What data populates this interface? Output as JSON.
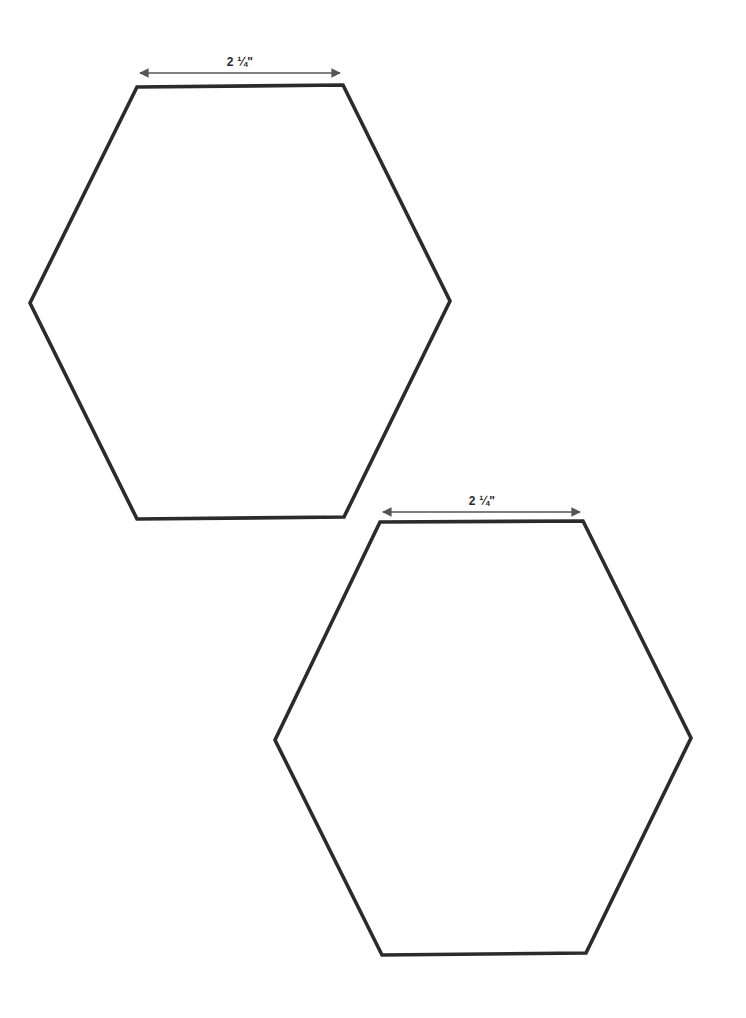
{
  "document": {
    "type": "hexagon template",
    "colors": {
      "outline": "#2b2b2b",
      "dimension": "#555555",
      "background": "#ffffff"
    }
  },
  "hexagons": [
    {
      "id": "hexagon-1",
      "side_label": "2 ¼\"",
      "points": [
        [
          137,
          87
        ],
        [
          343,
          85
        ],
        [
          450,
          301
        ],
        [
          344,
          517
        ],
        [
          137,
          519
        ],
        [
          30,
          303
        ]
      ],
      "dimension": {
        "x1": 140,
        "x2": 340,
        "y": 73,
        "label_x": 240,
        "label_y": 55
      }
    },
    {
      "id": "hexagon-2",
      "side_label": "2 ¼\"",
      "points": [
        [
          380,
          522
        ],
        [
          583,
          521
        ],
        [
          691,
          738
        ],
        [
          586,
          953
        ],
        [
          382,
          955
        ],
        [
          275,
          740
        ]
      ],
      "dimension": {
        "x1": 383,
        "x2": 580,
        "y": 512,
        "label_x": 482,
        "label_y": 494
      }
    }
  ]
}
